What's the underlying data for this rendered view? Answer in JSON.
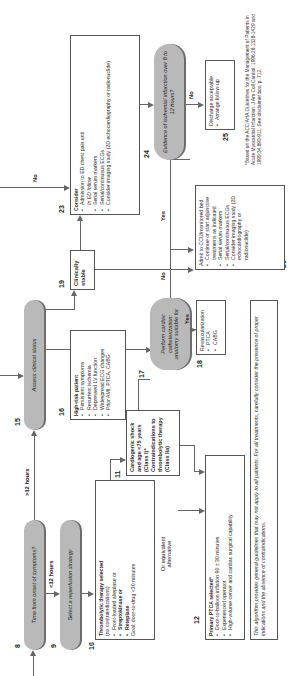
{
  "nodes": {
    "n8": {
      "num": "8",
      "text": "Time from onset of symptoms?"
    },
    "n9": {
      "num": "9",
      "text": "Select a reperfusion strategy"
    },
    "n10": {
      "num": "10",
      "title": "Thrombolytic therapy selected",
      "subtitle": "(no contraindications)",
      "items": [
        "Front-loaded alteplase or",
        "Streptokinase or",
        "Reteplase"
      ],
      "goal": "Goal: door-to-drug <30 minutes"
    },
    "n11": {
      "num": "11",
      "text": "Cardiogenic shock and age <75 years (Class I)* Contraindications to thrombolytic therapy (Class IIa)"
    },
    "n12": {
      "num": "12",
      "title": "Primary PTCA selected*",
      "items": [
        "Door-to-balloon inflation 90 ± 30 minutes",
        "Experienced operator",
        "High-volume center and cardiac surgical capability"
      ]
    },
    "n15": {
      "num": "15",
      "text": "Assess clinical status"
    },
    "n16": {
      "num": "16",
      "title": "High-risk patient",
      "items": [
        "Persistent symptoms",
        "Recurrent ischemia",
        "Depressed LV function",
        "Widespread ECG changes",
        "Prior AMI, PTCA, CABG"
      ]
    },
    "n17": {
      "num": "17",
      "text": "Perform cardiac catheterization: anatomy suitable for"
    },
    "n18": {
      "num": "18",
      "title": "Revascularization",
      "items": [
        "PTCA",
        "CABG"
      ]
    },
    "n19": {
      "num": "19",
      "text": "Clinically stable"
    },
    "n20": {
      "num": "20",
      "title": "Admit to CCU/monitored bed",
      "items": [
        "Continue or start adjunctive treatments as indicated",
        "Serial serum markers",
        "Serial/continuous ECGs",
        "Consider imaging study (2D echocardiography or radionuclide)"
      ]
    },
    "n23": {
      "num": "23",
      "title": "Consider",
      "items": [
        "Admission to ED chest pain unit",
        "In ED follow",
        "Serial serum markers",
        "Serial/continuous ECGs",
        "Consider imaging study (2D echocardiography or radionuclide)"
      ]
    },
    "n24": {
      "num": "24",
      "text": "Evidence of ischemia/ infarction over 8 to 12 hours?"
    },
    "n25": {
      "num": "25",
      "title": "Discharge acceptable",
      "items": [
        "Arrange follow-up"
      ]
    }
  },
  "edge_labels": {
    "lt12": "<12 hours",
    "gt12": ">12 hours",
    "or_alt": "Or equivalent alternative",
    "yes17": "Yes",
    "no17": "No",
    "yes24": "Yes",
    "no24": "No",
    "no_top": "No"
  },
  "disclaimer": "This algorithm provides general guidelines that may not apply to all patients. For all treatments, carefully consider the presence of proper indications and the absence of contraindications.",
  "footnote": "*Based on the ACC/AHA Guidelines for the Management of Patients in Acute Myocardial Infarction. J Am Coll Cardiol. 1996;28:1328-1429 and 1999;34:890-911. See disclaimer box, p. 712.",
  "colors": {
    "pill_fill": "#b9b9b9",
    "pill_shadow": "#6d6d6d",
    "line": "#666666",
    "border": "#555555"
  }
}
